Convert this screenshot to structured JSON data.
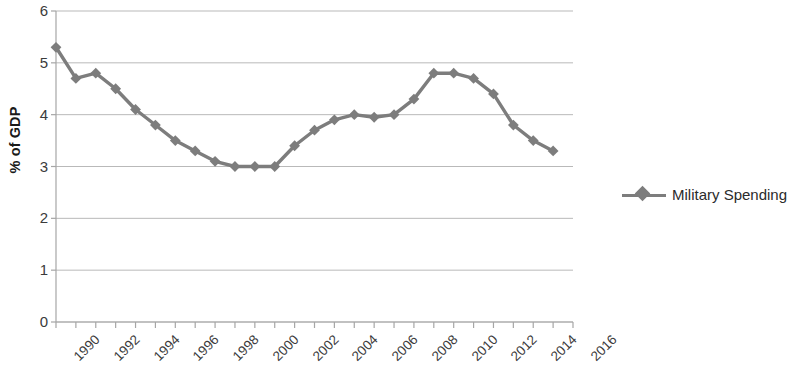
{
  "chart_data": {
    "type": "line",
    "title": "",
    "subtitle": "",
    "xlabel": "",
    "ylabel": "% of GDP",
    "xlim": [
      1990,
      2016
    ],
    "ylim": [
      0,
      6
    ],
    "ytick_labels": [
      "6",
      "5",
      "4",
      "3",
      "2",
      "1",
      "0"
    ],
    "ytick_values": [
      6,
      5,
      4,
      3,
      2,
      1,
      0
    ],
    "xtick_labels": [
      "1990",
      "1992",
      "1994",
      "1996",
      "1998",
      "2000",
      "2002",
      "2004",
      "2006",
      "2008",
      "2010",
      "2012",
      "2014",
      "2016"
    ],
    "xtick_values": [
      1990,
      1992,
      1994,
      1996,
      1998,
      2000,
      2002,
      2004,
      2006,
      2008,
      2010,
      2012,
      2014,
      2016
    ],
    "grid": "horizontal",
    "legend_position": "right",
    "x": [
      1990,
      1991,
      1992,
      1993,
      1994,
      1995,
      1996,
      1997,
      1998,
      1999,
      2000,
      2001,
      2002,
      2003,
      2004,
      2005,
      2006,
      2007,
      2008,
      2009,
      2010,
      2011,
      2012,
      2013,
      2014,
      2015
    ],
    "series": [
      {
        "name": "Military Spending",
        "color": "#7d7d7d",
        "marker": "diamond",
        "values": [
          5.3,
          4.7,
          4.8,
          4.5,
          4.1,
          3.8,
          3.5,
          3.3,
          3.1,
          3.0,
          3.0,
          3.0,
          3.4,
          3.7,
          3.9,
          4.0,
          3.95,
          4.0,
          4.3,
          4.8,
          4.8,
          4.7,
          4.4,
          3.8,
          3.5,
          3.3
        ]
      }
    ]
  },
  "legend": {
    "entries": [
      {
        "label": "Military Spending"
      }
    ]
  },
  "axis": {
    "y_title": "% of GDP"
  },
  "colors": {
    "series": "#7d7d7d",
    "grid": "#b9b9b9",
    "axis": "#a6a6a6",
    "text": "#3b3b3b"
  }
}
